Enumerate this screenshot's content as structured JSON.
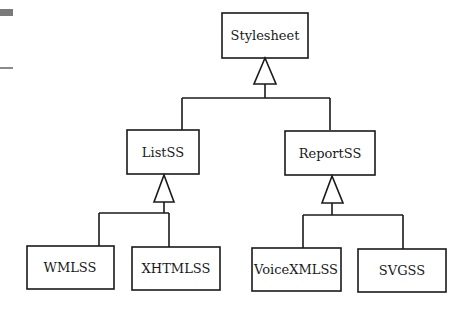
{
  "diagram": {
    "type": "uml-class-inheritance",
    "classes": {
      "root": "Stylesheet",
      "list": "ListSS",
      "report": "ReportSS",
      "wml": "WMLSS",
      "xhtml": "XHTMLSS",
      "voicexml": "VoiceXMLSS",
      "svg": "SVGSS"
    },
    "relationships": [
      {
        "child": "ListSS",
        "parent": "Stylesheet",
        "type": "generalization"
      },
      {
        "child": "ReportSS",
        "parent": "Stylesheet",
        "type": "generalization"
      },
      {
        "child": "WMLSS",
        "parent": "ListSS",
        "type": "generalization"
      },
      {
        "child": "XHTMLSS",
        "parent": "ListSS",
        "type": "generalization"
      },
      {
        "child": "VoiceXMLSS",
        "parent": "ReportSS",
        "type": "generalization"
      },
      {
        "child": "SVGSS",
        "parent": "ReportSS",
        "type": "generalization"
      }
    ]
  }
}
